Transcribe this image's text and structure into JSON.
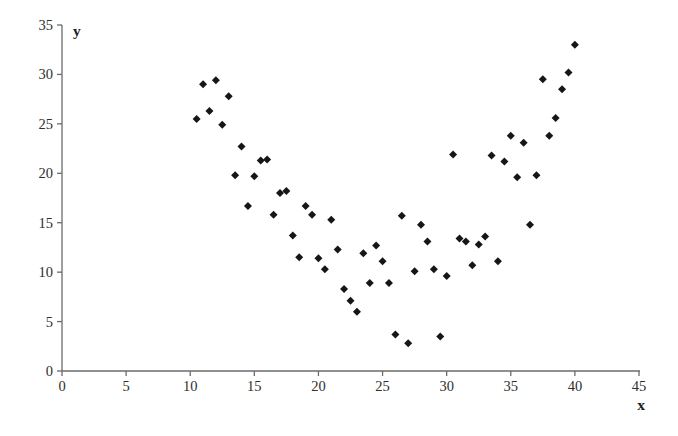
{
  "chart_data": {
    "type": "scatter",
    "title": "",
    "xlabel": "x",
    "ylabel": "y",
    "xlim": [
      0,
      45
    ],
    "ylim": [
      0,
      35
    ],
    "x_ticks": [
      0,
      5,
      10,
      15,
      20,
      25,
      30,
      35,
      40,
      45
    ],
    "y_ticks": [
      0,
      5,
      10,
      15,
      20,
      25,
      30,
      35
    ],
    "grid": false,
    "legend": false,
    "marker": "diamond",
    "marker_color": "#161616",
    "axis_color": "#6b6b6b",
    "tick_label_color": "#2e2e2e",
    "points": [
      [
        10.5,
        25.5
      ],
      [
        11,
        29.0
      ],
      [
        11.5,
        26.3
      ],
      [
        12,
        29.4
      ],
      [
        12.5,
        24.9
      ],
      [
        13,
        27.8
      ],
      [
        13.5,
        19.8
      ],
      [
        14,
        22.7
      ],
      [
        14.5,
        16.7
      ],
      [
        15,
        19.7
      ],
      [
        15.5,
        21.3
      ],
      [
        16,
        21.4
      ],
      [
        16.5,
        15.8
      ],
      [
        17,
        18.0
      ],
      [
        17.5,
        18.2
      ],
      [
        18,
        13.7
      ],
      [
        18.5,
        11.5
      ],
      [
        19,
        16.7
      ],
      [
        19.5,
        15.8
      ],
      [
        20,
        11.4
      ],
      [
        20.5,
        10.3
      ],
      [
        21,
        15.3
      ],
      [
        21.5,
        12.3
      ],
      [
        22,
        8.3
      ],
      [
        22.5,
        7.1
      ],
      [
        23,
        6.0
      ],
      [
        23.5,
        11.9
      ],
      [
        24,
        8.9
      ],
      [
        24.5,
        12.7
      ],
      [
        25,
        11.1
      ],
      [
        25.5,
        8.9
      ],
      [
        26,
        3.7
      ],
      [
        26.5,
        15.7
      ],
      [
        27,
        2.8
      ],
      [
        27.5,
        10.1
      ],
      [
        28,
        14.8
      ],
      [
        28.5,
        13.1
      ],
      [
        29,
        10.3
      ],
      [
        29.5,
        3.5
      ],
      [
        30,
        9.6
      ],
      [
        30.5,
        21.9
      ],
      [
        31,
        13.4
      ],
      [
        31.5,
        13.1
      ],
      [
        32,
        10.7
      ],
      [
        32.5,
        12.8
      ],
      [
        33,
        13.6
      ],
      [
        33.5,
        21.8
      ],
      [
        34,
        11.1
      ],
      [
        34.5,
        21.2
      ],
      [
        35,
        23.8
      ],
      [
        35.5,
        19.6
      ],
      [
        36,
        23.1
      ],
      [
        36.5,
        14.8
      ],
      [
        37,
        19.8
      ],
      [
        37.5,
        29.5
      ],
      [
        38,
        23.8
      ],
      [
        38.5,
        25.6
      ],
      [
        39,
        28.5
      ],
      [
        39.5,
        30.2
      ],
      [
        40,
        33.0
      ]
    ]
  }
}
